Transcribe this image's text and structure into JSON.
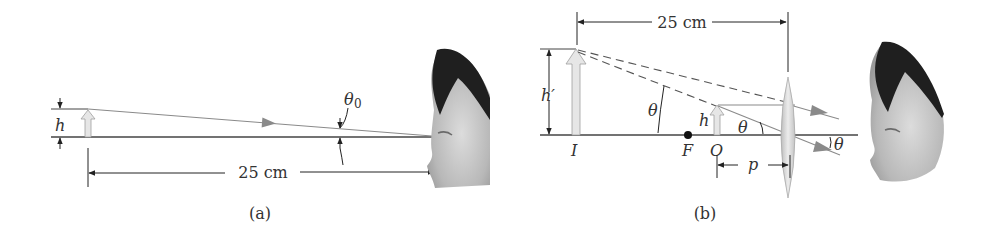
{
  "figure": {
    "type": "optics-diagram",
    "colors": {
      "line": "#444444",
      "ray": "#8a8a8a",
      "arrow_fill": "#e6e6e6",
      "arrow_stroke": "#9a9a9a",
      "lens_fill": "#d9d9d9",
      "hair": "#1a1a1a",
      "skin": "#c8c8c8"
    }
  },
  "panel_a": {
    "caption": "(a)",
    "height_label": "h",
    "angle_label": "θ",
    "angle_subscript": "0",
    "distance_label": "25 cm"
  },
  "panel_b": {
    "caption": "(b)",
    "distance_label": "25 cm",
    "image_height_label": "h′",
    "object_height_label": "h",
    "image_label": "I",
    "focal_label": "F",
    "object_label": "O",
    "object_distance_label": "p",
    "angle_labels": [
      "θ",
      "θ",
      "θ"
    ]
  }
}
